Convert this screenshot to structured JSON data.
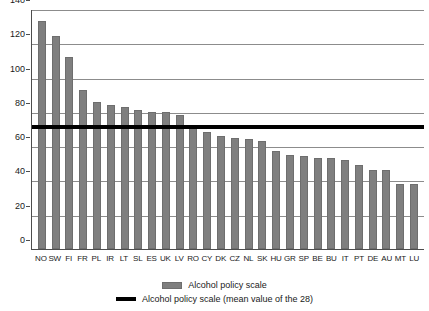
{
  "chart_data": {
    "type": "bar",
    "title": "",
    "xlabel": "",
    "ylabel": "",
    "ylim": [
      0,
      140
    ],
    "ytick_step": 20,
    "grid": true,
    "legend_position": "bottom",
    "categories": [
      "NO",
      "SW",
      "FI",
      "FR",
      "PL",
      "IR",
      "LT",
      "SL",
      "ES",
      "UK",
      "LV",
      "RO",
      "CY",
      "DK",
      "CZ",
      "NL",
      "SK",
      "HU",
      "GR",
      "SP",
      "BE",
      "BU",
      "IT",
      "PT",
      "DE",
      "AU",
      "MT",
      "LU"
    ],
    "values": [
      133,
      124,
      112,
      93,
      86,
      84,
      83,
      81,
      80,
      80,
      78,
      72,
      68,
      66,
      65,
      64,
      63,
      57,
      55,
      54,
      53,
      53,
      52,
      49,
      46,
      46,
      38,
      38
    ],
    "series": [
      {
        "name": "Alcohol policy scale",
        "type": "bar",
        "color": "#7f7f7f",
        "values": [
          133,
          124,
          112,
          93,
          86,
          84,
          83,
          81,
          80,
          80,
          78,
          72,
          68,
          66,
          65,
          64,
          63,
          57,
          55,
          54,
          53,
          53,
          52,
          49,
          46,
          46,
          38,
          38
        ]
      },
      {
        "name": "Alcohol policy scale (mean value of the 28)",
        "type": "line",
        "color": "#000000",
        "value": 72
      }
    ],
    "ytick_labels": [
      "140",
      "120",
      "100",
      "80",
      "60",
      "40",
      "20",
      "0"
    ],
    "ytick_values": [
      140,
      120,
      100,
      80,
      60,
      40,
      20,
      0
    ],
    "mean_line_value": 72,
    "annotations": []
  },
  "legend": {
    "items": [
      {
        "label": "Alcohol policy scale",
        "marker": "bar-swatch",
        "color": "#7f7f7f"
      },
      {
        "label": "Alcohol policy scale (mean value of the 28)",
        "marker": "line-swatch",
        "color": "#000000"
      }
    ]
  },
  "colors": {
    "bar": "#7f7f7f",
    "bar_border": "#6e6e6e",
    "mean_line": "#000000",
    "gridline": "#8c8c8c",
    "axis": "#4d4d4d",
    "background": "#ffffff",
    "text": "#1a1a1a"
  }
}
